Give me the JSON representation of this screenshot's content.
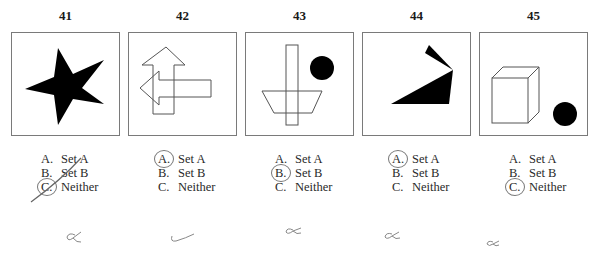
{
  "items": [
    {
      "number": "41",
      "figure": "filled-black-star",
      "options": [
        {
          "letter": "A.",
          "label": "Set A"
        },
        {
          "letter": "B.",
          "label": "Set B"
        },
        {
          "letter": "C.",
          "label": "Neither"
        }
      ],
      "circled": "C",
      "handwritten_mark": "∝",
      "strikethrough": true
    },
    {
      "number": "42",
      "figure": "overlapping-outlined-arrows-up-and-left",
      "options": [
        {
          "letter": "A.",
          "label": "Set A"
        },
        {
          "letter": "B.",
          "label": "Set B"
        },
        {
          "letter": "C.",
          "label": "Neither"
        }
      ],
      "circled": "A",
      "handwritten_mark": "✓"
    },
    {
      "number": "43",
      "figure": "rectangle-trapezoid-and-black-circle",
      "options": [
        {
          "letter": "A.",
          "label": "Set A"
        },
        {
          "letter": "B.",
          "label": "Set B"
        },
        {
          "letter": "C.",
          "label": "Neither"
        }
      ],
      "circled": "B",
      "handwritten_mark": "∝"
    },
    {
      "number": "44",
      "figure": "black-triangles",
      "options": [
        {
          "letter": "A.",
          "label": "Set A"
        },
        {
          "letter": "B.",
          "label": "Set B"
        },
        {
          "letter": "C.",
          "label": "Neither"
        }
      ],
      "circled": "A",
      "handwritten_mark": "∝"
    },
    {
      "number": "45",
      "figure": "outlined-cube-and-black-circle",
      "options": [
        {
          "letter": "A.",
          "label": "Set A"
        },
        {
          "letter": "B.",
          "label": "Set B"
        },
        {
          "letter": "C.",
          "label": "Neither"
        }
      ],
      "circled": "C",
      "handwritten_mark": "∝"
    }
  ],
  "colors": {
    "ink": "#000000",
    "box_border": "#7a7a7a",
    "pencil": "#777777"
  }
}
